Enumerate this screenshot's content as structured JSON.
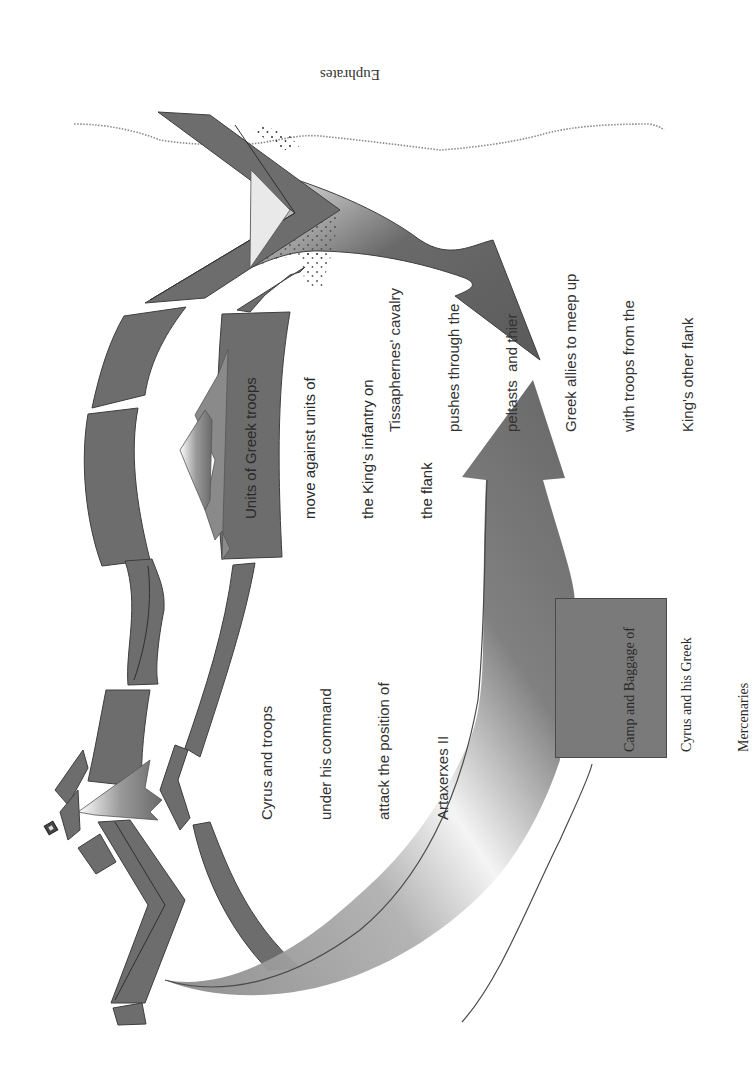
{
  "diagram": {
    "orientation": "page rotated 90 degrees counter-clockwise",
    "colors": {
      "unit_fill": "#6d6d6d",
      "unit_stroke": "#3e3e3e",
      "river": "#8a8a8a",
      "text": "#333333",
      "background": "#ffffff"
    },
    "river": {
      "label": "Euphrates"
    },
    "annotations": {
      "tissaphernes": {
        "lines": [
          "Tissaphernes' cavalry",
          "pushes through the",
          "peltasts  and thier",
          "Greek allies to meep up",
          "with troops from the",
          "King's other flank"
        ]
      },
      "greek_units": {
        "lines": [
          "Units of Greek troops",
          "move against units of",
          "the King's infantry on",
          "the flank"
        ]
      },
      "cyrus": {
        "lines": [
          "Cyrus and troops",
          "under his command",
          "attack the position of",
          "Artaxerxes II"
        ]
      },
      "camp": {
        "lines": [
          "Camp and Baggage of",
          "Cyrus and his Greek",
          "Mercenaries"
        ]
      }
    },
    "elements": [
      {
        "name": "euphrates-river",
        "type": "dotted-line"
      },
      {
        "name": "greek-right-wing-chevrons",
        "type": "chevron"
      },
      {
        "name": "peltasts-dotted-zone",
        "type": "stippled-area"
      },
      {
        "name": "tissaphernes-cavalry-arrow",
        "type": "curved-arrow"
      },
      {
        "name": "royal-army-return-arrow",
        "type": "curved-arrow"
      },
      {
        "name": "greek-infantry-blocks",
        "type": "curved-blocks"
      },
      {
        "name": "king-infantry-blocks",
        "type": "curved-blocks"
      },
      {
        "name": "greek-advance-arrow",
        "type": "notched-arrow"
      },
      {
        "name": "cyrus-attack-arrow",
        "type": "notched-arrow"
      },
      {
        "name": "artaxerxes-position",
        "type": "square-marker"
      },
      {
        "name": "camp-baggage-box",
        "type": "box"
      }
    ]
  }
}
